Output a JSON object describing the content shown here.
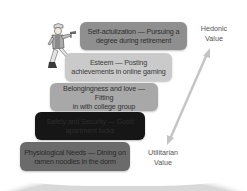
{
  "diagram": {
    "levels": [
      {
        "level": 5,
        "name": "Self-actualization",
        "example": "Pursuing a degree during retirement",
        "line1": "Self-actulization — Pursuing a",
        "line2": "degree during retirement",
        "fill": "#8f8f8f",
        "text_color": "#2e2e2e"
      },
      {
        "level": 4,
        "name": "Esteem",
        "example": "Posting achievements in online gaming",
        "line1": "Esteem — Posting",
        "line2": "achievements in online gaming",
        "fill": "#cacaca",
        "text_color": "#3a3a3a"
      },
      {
        "level": 3,
        "name": "Belongingness and love",
        "example": "Fitting in with college group",
        "line1": "Belongingness and love — Fitting",
        "line2": "in with college group",
        "fill": "#a8a8a8",
        "text_color": "#333333"
      },
      {
        "level": 2,
        "name": "Safety and Security",
        "example": "Good apartment locks",
        "line1": "Safety and Security — Good",
        "line2": "apartment locks",
        "fill": "#161616",
        "text_color": "#2c2c2c"
      },
      {
        "level": 1,
        "name": "Physiological Needs",
        "example": "Dining on ramen noodles in the dorm",
        "line1": "Physiological Needs — Dining on",
        "line2": "ramen noodles in the dorm",
        "fill": "#6b6b6b",
        "text_color": "#2a2a2a"
      }
    ],
    "axis": {
      "top_label_line1": "Hedonic",
      "top_label_line2": "Value",
      "bottom_label_line1": "Utilitarian",
      "bottom_label_line2": "Value",
      "arrow_color": "#c4c4c4",
      "direction": "bidirectional"
    },
    "illustration": "climber-figure"
  }
}
